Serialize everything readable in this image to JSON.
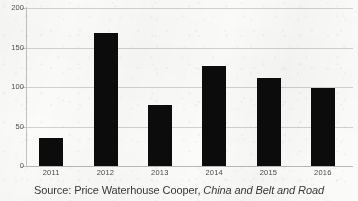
{
  "caption": {
    "prefix": "Source: Price Waterhouse Cooper,",
    "title": "China and Belt and Road"
  },
  "axis": {
    "y_ticks": [
      "0",
      "50",
      "100",
      "150",
      "200"
    ],
    "x_ticks": [
      "2011",
      "2012",
      "2013",
      "2014",
      "2015",
      "2016"
    ]
  },
  "colors": {
    "bar": "#0c0c0c",
    "gridline": "#d2d2d0",
    "axis": "#c2c2c0",
    "background": "#fbfbfa",
    "label_text": "#4a4a4a",
    "caption_text": "#3a3a3a"
  },
  "chart_data": {
    "type": "bar",
    "title": "",
    "subtitle": "",
    "xlabel": "",
    "ylabel": "",
    "categories": [
      "2011",
      "2012",
      "2013",
      "2014",
      "2015",
      "2016"
    ],
    "values": [
      35,
      168,
      77,
      127,
      112,
      99
    ],
    "ylim": [
      0,
      200
    ],
    "ytick_values": [
      0,
      50,
      100,
      150,
      200
    ],
    "grid": true,
    "legend": "none",
    "annotations": [],
    "source_note": "Source: Price Waterhouse Cooper, China and Belt and Road"
  }
}
